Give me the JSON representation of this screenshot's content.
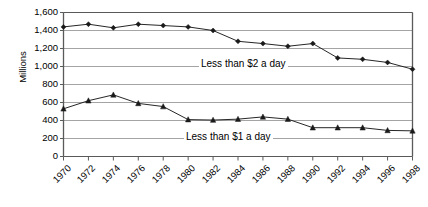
{
  "chart_data": {
    "type": "line",
    "title": "",
    "xlabel": "",
    "ylabel": "Millions",
    "ylim": [
      0,
      1600
    ],
    "ytick_step": 200,
    "yticks": [
      "0",
      "200",
      "400",
      "600",
      "800",
      "1,000",
      "1,200",
      "1,400",
      "1,600"
    ],
    "grid": true,
    "legend_position": "inline-annotations",
    "x": [
      1970,
      1972,
      1974,
      1976,
      1978,
      1980,
      1982,
      1984,
      1986,
      1988,
      1990,
      1992,
      1994,
      1996,
      1998
    ],
    "xticks": [
      "1970",
      "1972",
      "1974",
      "1976",
      "1978",
      "1980",
      "1982",
      "1984",
      "1986",
      "1988",
      "1990",
      "1992",
      "1994",
      "1996",
      "1998"
    ],
    "series": [
      {
        "name": "Less than $2 a day",
        "marker": "diamond",
        "color": "#1a1a1a",
        "values": [
          1440,
          1470,
          1430,
          1470,
          1455,
          1440,
          1400,
          1280,
          1255,
          1225,
          1255,
          1095,
          1080,
          1045,
          970
        ]
      },
      {
        "name": "Less than $1 a day",
        "marker": "triangle",
        "color": "#1a1a1a",
        "values": [
          530,
          620,
          685,
          590,
          555,
          410,
          405,
          415,
          440,
          415,
          320,
          320,
          320,
          290,
          285
        ]
      }
    ],
    "annotations": [
      {
        "text": "Less than $2 a day",
        "x": 1981,
        "y": 1100
      },
      {
        "text": "Less than $1 a day",
        "x": 1980,
        "y": 330
      }
    ],
    "axis_color": "#5a5a5a",
    "gridline_color": "#9a9a9a",
    "plot_background": "#ffffff"
  },
  "axes": {
    "y_title": "Millions"
  }
}
